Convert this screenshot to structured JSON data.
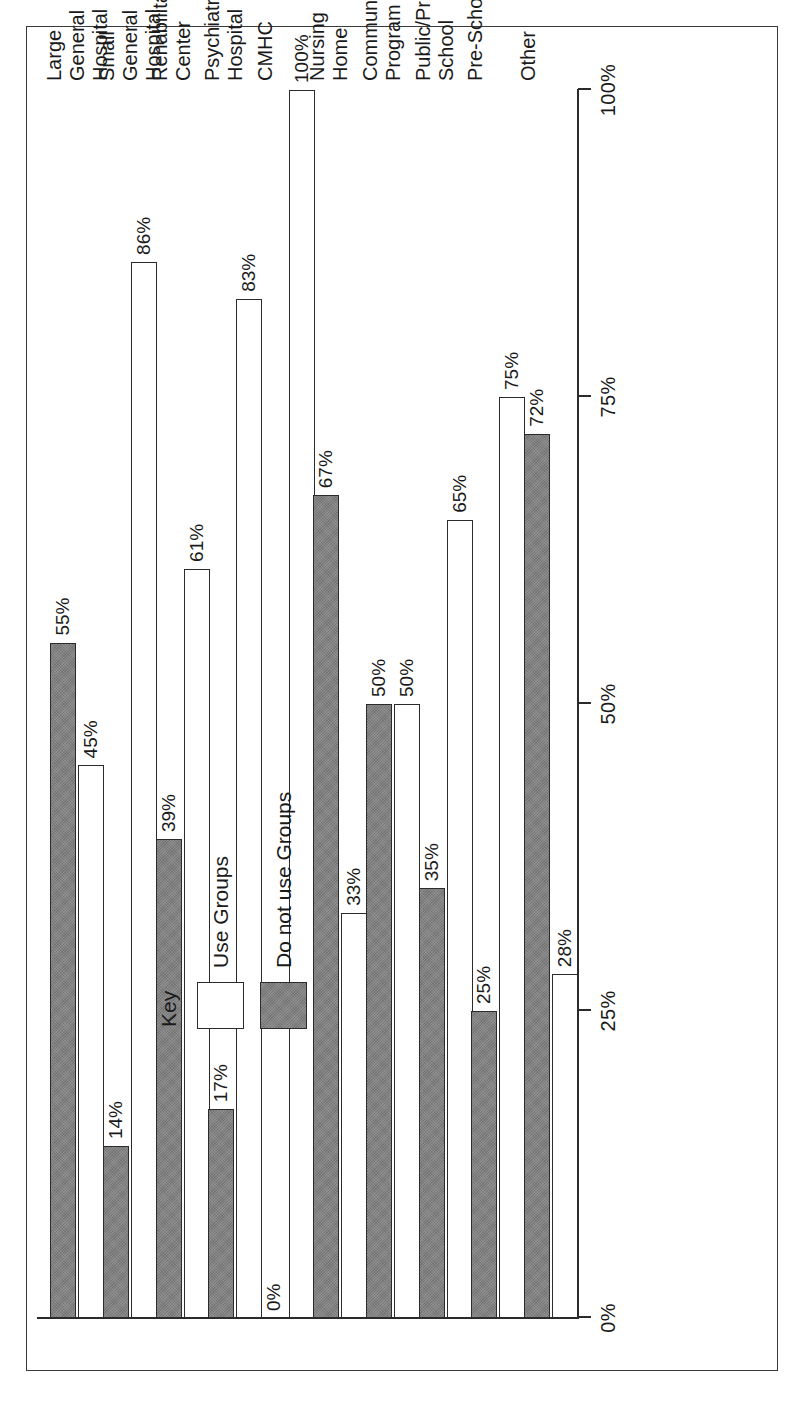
{
  "chart_data": {
    "type": "bar",
    "orientation": "horizontal-rotated",
    "title": "",
    "xlabel": "",
    "ylabel": "",
    "ylim": [
      0,
      100
    ],
    "grid": false,
    "legend_position": "upper-left-inside",
    "legend_title": "Key",
    "tick_labels": [
      "0%",
      "25%",
      "50%",
      "75%",
      "100%"
    ],
    "tick_values": [
      0,
      25,
      50,
      75,
      100
    ],
    "categories": [
      "Large General Hospital",
      "Small General Hospital",
      "Rehabilitation Center",
      "Psychiatric Hospital",
      "CMHC",
      "Nursing Home",
      "Community Program",
      "Public/Private School",
      "Pre-School",
      "Other"
    ],
    "category_lines": [
      [
        "Large",
        "General",
        "Hospital"
      ],
      [
        "Small",
        "General",
        "Hospital"
      ],
      [
        "Rehabilitation",
        "Center"
      ],
      [
        "Psychiatric",
        "Hospital"
      ],
      [
        "CMHC"
      ],
      [
        "Nursing",
        "Home"
      ],
      [
        "Community",
        "Program"
      ],
      [
        "Public/Private",
        "School"
      ],
      [
        "Pre-School"
      ],
      [
        "Other"
      ]
    ],
    "series": [
      {
        "name": "Use Groups",
        "color": "#ffffff",
        "values": [
          45,
          86,
          61,
          83,
          100,
          33,
          50,
          65,
          75,
          28
        ],
        "value_labels": [
          "45%",
          "86%",
          "61%",
          "83%",
          "100%",
          "33%",
          "50%",
          "65%",
          "75%",
          "28%"
        ]
      },
      {
        "name": "Do not use Groups",
        "color": "#808080",
        "values": [
          55,
          14,
          39,
          17,
          0,
          67,
          50,
          35,
          25,
          72
        ],
        "value_labels": [
          "55%",
          "14%",
          "39%",
          "17%",
          "0%",
          "67%",
          "50%",
          "35%",
          "25%",
          "72%"
        ]
      }
    ]
  },
  "legend": {
    "title": "Key",
    "entries": [
      {
        "label": "Use Groups",
        "swatch": "white-square-icon"
      },
      {
        "label": "Do not use Groups",
        "swatch": "gray-square-icon"
      }
    ]
  },
  "colors": {
    "use_groups": "#ffffff",
    "do_not_use_groups": "#808080",
    "axis": "#2b2b2b",
    "frame": "#3a3a3a",
    "text": "#1a1a1a"
  }
}
